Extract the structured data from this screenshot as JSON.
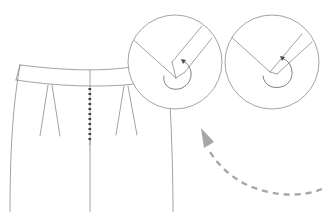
{
  "diagram": {
    "title": "",
    "colors": {
      "background": "#ffffff",
      "line": "#8a8a8a",
      "zipper": "#3a3a3a",
      "dashed_arrow": "#a6a6a6"
    },
    "elements": [
      {
        "id": "garment-body",
        "type": "line-drawing",
        "label": "garment front"
      },
      {
        "id": "waistband",
        "type": "band",
        "label": "waistband"
      },
      {
        "id": "center-zipper",
        "type": "zipper",
        "label": "center front zipper"
      },
      {
        "id": "left-dart",
        "type": "dart",
        "label": "left front dart"
      },
      {
        "id": "right-dart",
        "type": "dart",
        "label": "right front dart"
      },
      {
        "id": "detail-callout-1",
        "type": "circle-callout",
        "label": "corner fold detail (step 1)"
      },
      {
        "id": "detail-callout-2",
        "type": "circle-callout",
        "label": "corner fold detail (step 2)"
      },
      {
        "id": "dashed-arrow",
        "type": "curved-arrow",
        "label": "direction arrow pointing up-left"
      }
    ],
    "text_labels": []
  }
}
